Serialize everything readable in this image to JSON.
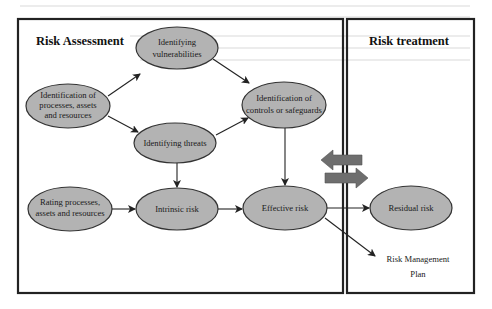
{
  "panels": {
    "assessment": {
      "title": "Risk Assessment"
    },
    "treatment": {
      "title": "Risk treatment"
    }
  },
  "nodes": {
    "identification": {
      "lines": [
        "Identification of",
        "processes, assets",
        "and resources"
      ]
    },
    "vulnerabilities": {
      "lines": [
        "Identifying",
        "vulnerabilities"
      ]
    },
    "threats": {
      "lines": [
        "Identifying threats"
      ]
    },
    "controls": {
      "lines": [
        "Identification of",
        "controls or safeguards"
      ]
    },
    "rating": {
      "lines": [
        "Rating processes,",
        "assets and resources"
      ]
    },
    "intrinsic": {
      "lines": [
        "Intrinsic risk"
      ]
    },
    "effective": {
      "lines": [
        "Effective risk"
      ]
    },
    "residual": {
      "lines": [
        "Residual risk"
      ]
    }
  },
  "outputs": {
    "plan": {
      "lines": [
        "Risk Management",
        "Plan"
      ]
    }
  },
  "colors": {
    "node_fill": "#b3b3b3",
    "exchange_arrows": "#6e6e6e"
  }
}
